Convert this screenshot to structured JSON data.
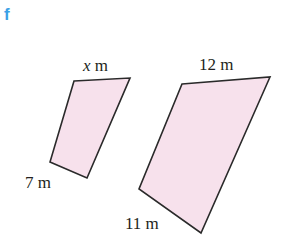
{
  "part_label": "f",
  "colors": {
    "part_label": "#3aa0e6",
    "shape_fill": "#f7e1ec",
    "stroke": "#2a2a2a",
    "text": "#231f20"
  },
  "small_shape": {
    "top_label_var": "x",
    "top_label_unit": " m",
    "side_label": "7 m"
  },
  "large_shape": {
    "top_label": "12 m",
    "side_label": "11 m"
  }
}
